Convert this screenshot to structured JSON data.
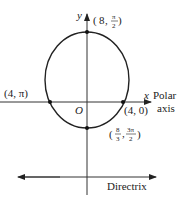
{
  "axes": {
    "x_label": "x",
    "y_label": "y",
    "origin_label": "O",
    "polar_axis_label_line1": "Polar",
    "polar_axis_label_line2": "axis"
  },
  "points": {
    "top": {
      "r": "8",
      "theta_num": "π",
      "theta_den": "2",
      "prefix": "(8, ",
      "suffix": ")"
    },
    "left": {
      "label": "(4, π)"
    },
    "right": {
      "label": "(4, 0)"
    },
    "bottom": {
      "r_num": "8",
      "r_den": "3",
      "theta_num": "3π",
      "theta_den": "2"
    }
  },
  "directrix": {
    "label": "Directrix"
  },
  "colors": {
    "stroke": "#222222",
    "background": "#ffffff"
  }
}
